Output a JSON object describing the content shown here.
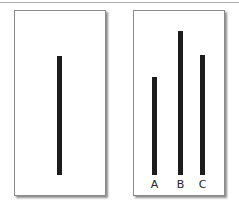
{
  "figure": {
    "reference_card": {
      "line": {
        "top": 45,
        "height": 119,
        "left": 42
      }
    },
    "comparison_card": {
      "lines": [
        {
          "label": "A",
          "top": 66,
          "height": 98,
          "left": 18
        },
        {
          "label": "B",
          "top": 20,
          "height": 144,
          "left": 44
        },
        {
          "label": "C",
          "top": 44,
          "height": 120,
          "left": 66
        }
      ]
    },
    "colors": {
      "line": "#1c1c1c",
      "card_border": "#8a8a8a",
      "background": "#ffffff"
    }
  }
}
